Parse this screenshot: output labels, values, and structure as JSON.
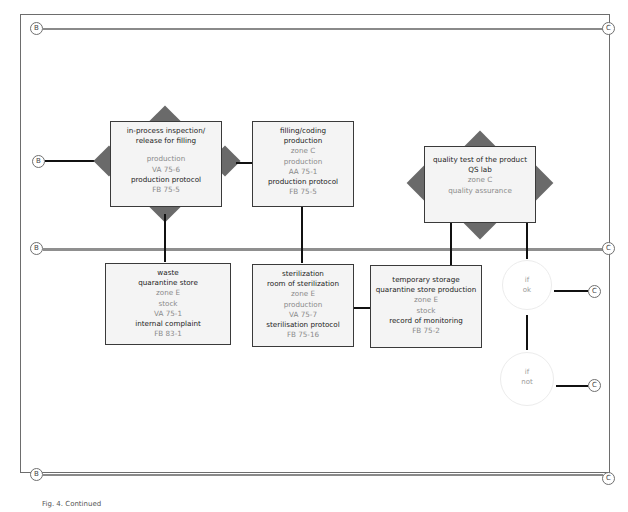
{
  "connectors": {
    "left": "B",
    "right": "C"
  },
  "boxes": {
    "inspection": {
      "lines": [
        "in-process inspection/",
        "release for filling",
        "",
        "production",
        "VA 75-6",
        "production protocol",
        "FB 75-5"
      ]
    },
    "filling": {
      "lines": [
        "filling/coding",
        "production",
        "zone C",
        "production",
        "AA 75-1",
        "production protocol",
        "FB 75-5"
      ]
    },
    "quality": {
      "lines": [
        "quality test of the product",
        "QS lab",
        "zone C",
        "quality assurance"
      ]
    },
    "waste": {
      "lines": [
        "waste",
        "quarantine store",
        "zone E",
        "stock",
        "VA 75-1",
        "internal complaint",
        "FB 83-1"
      ]
    },
    "sterilization": {
      "lines": [
        "sterilization",
        "room of sterilization",
        "zone E",
        "production",
        "VA 75-7",
        "sterilisation protocol",
        "FB 75-16"
      ]
    },
    "storage": {
      "lines": [
        "temporary storage",
        "quarantine store production",
        "zone E",
        "stock",
        "record of monitoring",
        "FB 75-2"
      ]
    }
  },
  "decisions": {
    "ok": [
      "if",
      "ok"
    ],
    "not": [
      "if",
      "not"
    ]
  },
  "caption": "Fig. 4. Continued"
}
